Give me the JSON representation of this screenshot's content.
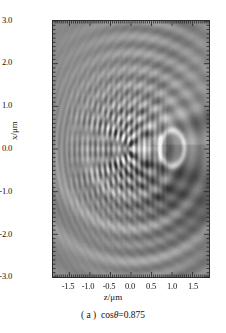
{
  "page_header": "",
  "figure": {
    "caption_prefix": "( a )",
    "caption_text": "cos",
    "caption_symbol": "θ",
    "caption_value": "=0.875",
    "caption_full": "( a )  cosθ=0.875",
    "xlabel": "z/μm",
    "ylabel": "x/μm",
    "xticks": [
      "-1.5",
      "-1.0",
      "-0.5",
      "0.0",
      "0.5",
      "1.0",
      "1.5"
    ],
    "yticks": [
      "3.0",
      "2.0",
      "1.0",
      "0.0",
      "-1.0",
      "-2.0",
      "-3.0"
    ],
    "colors": {
      "background": "#ffffff",
      "plot_mid_gray": "#8e8e8e",
      "plot_dark": "#3a3a3a",
      "plot_bright": "#f2f2f2",
      "axis": "#2c2c2c",
      "text": "#111111"
    }
  },
  "chart_data": {
    "type": "heatmap",
    "xlabel": "z/μm",
    "ylabel": "x/μm",
    "xlim": [
      -1.9,
      1.9
    ],
    "ylim": [
      -3.0,
      3.0
    ],
    "xticks": [
      -1.5,
      -1.0,
      -0.5,
      0.0,
      0.5,
      1.0,
      1.5
    ],
    "yticks": [
      -3.0,
      -2.0,
      -1.0,
      0.0,
      1.0,
      2.0,
      3.0
    ],
    "minor_ticks": true,
    "grid": false,
    "legend": null,
    "colormap": "gray",
    "value_range": [
      0.0,
      1.0
    ],
    "features": [
      {
        "name": "caustic-ring",
        "z": 1.0,
        "x": 0.02,
        "rz": 0.3,
        "rx": 0.42,
        "peak": 0.97
      },
      {
        "name": "fringe-core",
        "z": -0.3,
        "x": 0.0,
        "fringe_spacing_um": 0.13,
        "extent_z": [
          -1.1,
          0.55
        ],
        "extent_x": [
          -1.2,
          1.3
        ]
      },
      {
        "name": "forward-shadow",
        "z": 1.45,
        "x": -0.9,
        "value": 0.28
      },
      {
        "name": "diagonal-rays",
        "quadrant": "upper-right",
        "count": 5
      },
      {
        "name": "lower-arcs",
        "quadrant": "lower",
        "count": 4
      }
    ],
    "series": [
      {
        "name": "intensity",
        "note": "field synthesised procedurally from the feature list above",
        "values": null
      }
    ]
  }
}
